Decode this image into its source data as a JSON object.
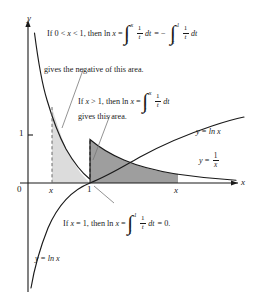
{
  "figure": {
    "colors": {
      "axis": "#1a1a1a",
      "curve": "#1a1a1a",
      "light_shade": "#d9d9d9",
      "dark_shade": "#9a9a9a",
      "dashed": "#555555",
      "leader": "#666666",
      "background": "#ffffff"
    }
  },
  "axes": {
    "y_axis_label": "y",
    "x_axis_label": "x",
    "origin_label": "0",
    "y_tick_label": "1",
    "x_tick_left_label": "x",
    "x_tick_one_label": "1",
    "x_tick_right_label": "x"
  },
  "curves": {
    "log_label_right": {
      "y": "y",
      "eq": "=",
      "fn": "ln x"
    },
    "recip_label": {
      "y": "y",
      "eq": "=",
      "num": "1",
      "den": "x"
    },
    "log_label_bottom": {
      "y": "y",
      "eq": "=",
      "fn": "ln x"
    }
  },
  "annotations": {
    "negative_area": {
      "line1_prefix": "If 0 <",
      "line1_var": "x",
      "line1_mid": "< 1, then ln",
      "line1_var2": "x",
      "line1_eq": "=",
      "integral1": {
        "lower": "1",
        "upper": "x",
        "num": "1",
        "den": "t",
        "dt": "dt"
      },
      "minus": "=  −",
      "integral2": {
        "lower": "x",
        "upper": "1",
        "num": "1",
        "den": "t",
        "dt": "dt"
      },
      "line2": "gives the negative of this area."
    },
    "positive_area": {
      "line1_prefix": "If",
      "line1_var": "x",
      "line1_mid": "> 1, then ln",
      "line1_var2": "x",
      "line1_eq": "=",
      "integral": {
        "lower": "1",
        "upper": "x",
        "num": "1",
        "den": "t",
        "dt": "dt"
      },
      "line2": "gives this area."
    },
    "zero_area": {
      "prefix": "If",
      "var": "x",
      "mid": "= 1, then ln",
      "var2": "x",
      "eq": "=",
      "integral": {
        "lower": "1",
        "upper": "1",
        "num": "1",
        "den": "t",
        "dt": "dt"
      },
      "suffix": "= 0."
    }
  }
}
